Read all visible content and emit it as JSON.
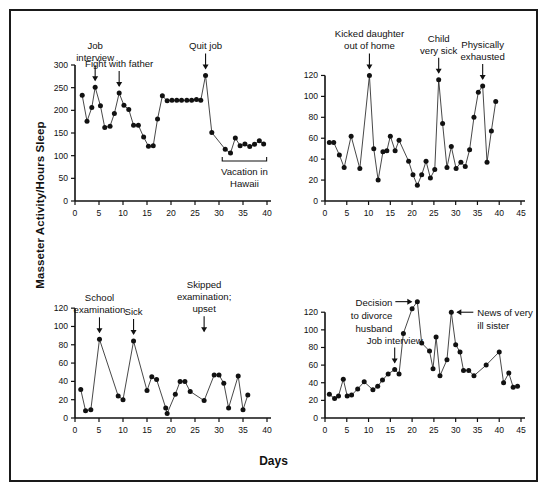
{
  "figure": {
    "ylabel": "Masseter Activity/Hours Sleep",
    "xlabel": "Days",
    "background": "#ffffff",
    "ink": "#111111"
  },
  "chart_data": [
    {
      "id": "panel-top-left",
      "type": "line",
      "title": "",
      "xlabel": "",
      "ylabel": "Masseter Activity/Hours Sleep",
      "xlim": [
        0,
        40
      ],
      "ylim": [
        0,
        300
      ],
      "xticks": [
        0,
        5,
        10,
        15,
        20,
        25,
        30,
        35,
        40
      ],
      "yticks": [
        0,
        50,
        100,
        150,
        200,
        250,
        300
      ],
      "grid": false,
      "legend": "none",
      "marker": "filled-circle",
      "x": [
        1.5,
        2.5,
        3.5,
        4.2,
        5.3,
        6.2,
        7.3,
        8.2,
        9.2,
        10.2,
        11.2,
        12.2,
        13.2,
        14.3,
        15.3,
        16.3,
        17.2,
        18.2,
        19.2,
        20.2,
        21.2,
        22.2,
        23.3,
        24.3,
        25.3,
        26.2,
        27.2,
        28.5,
        31.3,
        32.4,
        33.4,
        34.4,
        35.4,
        36.4,
        37.4,
        38.4,
        39.3
      ],
      "y": [
        233,
        176,
        206,
        251,
        210,
        162,
        165,
        193,
        238,
        211,
        202,
        167,
        167,
        141,
        121,
        122,
        181,
        232,
        221,
        222,
        222,
        222,
        222,
        222,
        224,
        222,
        277,
        151,
        114,
        106,
        139,
        122,
        126,
        120,
        125,
        133,
        126
      ],
      "annotations": [
        {
          "name": "job-interview",
          "label": "Job\ninterview",
          "x": 4.2,
          "y": 251,
          "arrow": "down"
        },
        {
          "name": "fight-with-father",
          "label": "Fight with father",
          "x": 9.2,
          "y": 238,
          "arrow": "down"
        },
        {
          "name": "quit-job",
          "label": "Quit job",
          "x": 27.2,
          "y": 277,
          "arrow": "down"
        },
        {
          "name": "vacation-in-hawaii",
          "label": "Vacation in\nHawaii",
          "x_start": 31.3,
          "x_end": 39.3,
          "bracket": true
        }
      ]
    },
    {
      "id": "panel-top-right",
      "type": "line",
      "title": "",
      "xlabel": "",
      "ylabel": "Masseter Activity/Hours Sleep",
      "xlim": [
        0,
        45
      ],
      "ylim": [
        0,
        130
      ],
      "xticks": [
        0,
        5,
        10,
        15,
        20,
        25,
        30,
        35,
        40,
        45
      ],
      "yticks": [
        0,
        20,
        40,
        60,
        80,
        100,
        120
      ],
      "grid": false,
      "legend": "none",
      "marker": "filled-circle",
      "x": [
        1.0,
        2.0,
        3.3,
        4.4,
        6.0,
        8.0,
        10.2,
        11.2,
        12.2,
        13.3,
        14.2,
        15.0,
        16.1,
        17.0,
        19.2,
        20.2,
        21.2,
        22.2,
        23.2,
        24.2,
        25.2,
        26.1,
        27.0,
        28.0,
        29.0,
        30.1,
        31.2,
        32.2,
        33.2,
        34.2,
        35.2,
        36.2,
        37.2,
        38.2,
        39.2
      ],
      "y": [
        56,
        56,
        44,
        32,
        62,
        31,
        120,
        50,
        20,
        47,
        48,
        62,
        48,
        58,
        38,
        25,
        15,
        25,
        38,
        22,
        30,
        116,
        74,
        32,
        52,
        31,
        37,
        33,
        49,
        80,
        104,
        110,
        37,
        67,
        95
      ],
      "annotations": [
        {
          "name": "kicked-daughter-out-of-home",
          "label": "Kicked daughter\nout of home",
          "x": 10.2,
          "y": 120,
          "arrow": "down"
        },
        {
          "name": "child-very-sick",
          "label": "Child\nvery sick",
          "x": 26.1,
          "y": 116,
          "arrow": "down"
        },
        {
          "name": "physically-exhausted",
          "label": "Physically\nexhausted",
          "x": 36.2,
          "y": 110,
          "arrow": "down"
        }
      ]
    },
    {
      "id": "panel-bottom-left",
      "type": "line",
      "title": "",
      "xlabel": "Days",
      "ylabel": "Masseter Activity/Hours Sleep",
      "xlim": [
        0,
        40
      ],
      "ylim": [
        0,
        130
      ],
      "xticks": [
        0,
        5,
        10,
        15,
        20,
        25,
        30,
        35,
        40
      ],
      "yticks": [
        0,
        20,
        40,
        60,
        80,
        100,
        120
      ],
      "grid": false,
      "legend": "none",
      "marker": "filled-circle",
      "x": [
        1.2,
        2.2,
        3.3,
        5.1,
        9.0,
        10.0,
        12.2,
        15.0,
        16.0,
        17.0,
        18.9,
        19.2,
        20.9,
        21.9,
        22.9,
        24.0,
        26.9,
        29.0,
        30.0,
        31.0,
        32.0,
        34.0,
        35.0,
        36.0
      ],
      "y": [
        31,
        8,
        9,
        86,
        24,
        20,
        84,
        30,
        45,
        42,
        11,
        5,
        26,
        40,
        40,
        29,
        19,
        47,
        47,
        38,
        11,
        46,
        9,
        25,
        11
      ],
      "annotations": [
        {
          "name": "school-examination",
          "label": "School\nexamination",
          "x": 5.1,
          "y": 86,
          "arrow": "down"
        },
        {
          "name": "sick",
          "label": "Sick",
          "x": 12.2,
          "y": 84,
          "arrow": "down"
        },
        {
          "name": "skipped-examination-upset",
          "label": "Skipped\nexamination;\nupset",
          "x": 26.9,
          "y": 87,
          "arrow": "down"
        }
      ]
    },
    {
      "id": "panel-bottom-right",
      "type": "line",
      "title": "",
      "xlabel": "Days",
      "ylabel": "Masseter Activity/Hours Sleep",
      "xlim": [
        0,
        45
      ],
      "ylim": [
        0,
        135
      ],
      "xticks": [
        0,
        5,
        10,
        15,
        20,
        25,
        30,
        35,
        40,
        45
      ],
      "yticks": [
        0,
        20,
        40,
        60,
        80,
        100,
        120
      ],
      "grid": false,
      "legend": "none",
      "marker": "filled-circle",
      "x": [
        1.0,
        2.2,
        3.1,
        4.2,
        5.1,
        6.1,
        7.5,
        9.0,
        11.0,
        12.1,
        13.2,
        14.5,
        16.0,
        17.0,
        18.0,
        20.0,
        21.2,
        22.2,
        24.0,
        24.8,
        25.5,
        26.4,
        28.0,
        29.0,
        30.0,
        31.0,
        31.8,
        33.0,
        34.2,
        37.0,
        40.0,
        41.0,
        42.2,
        43.2,
        44.2
      ],
      "y": [
        27,
        22,
        25,
        44,
        25,
        26,
        33,
        41,
        32,
        36,
        43,
        50,
        55,
        50,
        96,
        124,
        132,
        85,
        76,
        56,
        92,
        48,
        66,
        120,
        83,
        75,
        54,
        54,
        48,
        60,
        75,
        40,
        51,
        35,
        36,
        58
      ],
      "annotations": [
        {
          "name": "decision-to-divorce-husband",
          "label": "Decision\nto divorce\nhusband",
          "x": 21.2,
          "y": 132,
          "arrow": "right"
        },
        {
          "name": "job-interview",
          "label": "Job interview",
          "x": 16.0,
          "y": 55,
          "arrow": "down"
        },
        {
          "name": "news-of-very-ill-sister",
          "label": "News of very\nill sister",
          "x": 29.0,
          "y": 120,
          "arrow": "left"
        }
      ]
    }
  ]
}
